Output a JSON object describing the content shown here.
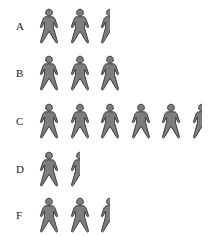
{
  "chart_data": {
    "type": "pictograph",
    "title": "",
    "xlabel": "",
    "ylabel": "",
    "icon": "person-icon",
    "unit_per_icon": 1,
    "categories": [
      "A",
      "B",
      "C",
      "D",
      "F"
    ],
    "values": [
      2.5,
      3,
      5.5,
      1.5,
      2.5
    ],
    "colors": {
      "icon_fill": "#7d7d7d",
      "icon_stroke": "#3f3f3f",
      "label": "#222222"
    },
    "grid": false,
    "legend": null
  },
  "rows": [
    {
      "label": "A",
      "value": 2.5,
      "top": 6
    },
    {
      "label": "B",
      "value": 3,
      "top": 53
    },
    {
      "label": "C",
      "value": 5.5,
      "top": 101
    },
    {
      "label": "D",
      "value": 1.5,
      "top": 149
    },
    {
      "label": "F",
      "value": 2.5,
      "top": 195
    }
  ]
}
